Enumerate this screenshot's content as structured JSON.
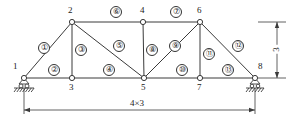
{
  "diagram": {
    "stroke_color": "#3a3a3a",
    "label_color": "#1a1a1a",
    "background": "#ffffff"
  },
  "nodes": [
    {
      "id": "1",
      "label": "1",
      "x": 24,
      "y": 78,
      "lx": 13,
      "ly": 62
    },
    {
      "id": "2",
      "label": "2",
      "x": 72,
      "y": 22,
      "lx": 68,
      "ly": 6
    },
    {
      "id": "3",
      "label": "3",
      "x": 72,
      "y": 78,
      "lx": 69,
      "ly": 83
    },
    {
      "id": "4",
      "label": "4",
      "x": 143,
      "y": 22,
      "lx": 140,
      "ly": 6
    },
    {
      "id": "5",
      "label": "5",
      "x": 144,
      "y": 78,
      "lx": 141,
      "ly": 83
    },
    {
      "id": "6",
      "label": "6",
      "x": 200,
      "y": 22,
      "lx": 197,
      "ly": 6
    },
    {
      "id": "7",
      "label": "7",
      "x": 200,
      "y": 78,
      "lx": 197,
      "ly": 83
    },
    {
      "id": "8",
      "label": "8",
      "x": 255,
      "y": 78,
      "lx": 258,
      "ly": 62
    }
  ],
  "members": [
    {
      "id": "1",
      "label": "①",
      "from": "1",
      "to": "2",
      "lx": 38,
      "ly": 42
    },
    {
      "id": "2",
      "label": "②",
      "from": "1",
      "to": "3",
      "lx": 48,
      "ly": 64
    },
    {
      "id": "3",
      "label": "③",
      "from": "2",
      "to": "3",
      "lx": 75,
      "ly": 44
    },
    {
      "id": "4",
      "label": "④",
      "from": "3",
      "to": "5",
      "lx": 103,
      "ly": 64
    },
    {
      "id": "5",
      "label": "⑤",
      "from": "2",
      "to": "5",
      "lx": 113,
      "ly": 40
    },
    {
      "id": "6",
      "label": "⑥",
      "from": "2",
      "to": "4",
      "lx": 110,
      "ly": 6
    },
    {
      "id": "7",
      "label": "⑦",
      "from": "4",
      "to": "6",
      "lx": 170,
      "ly": 6
    },
    {
      "id": "8",
      "label": "⑧",
      "from": "4",
      "to": "5",
      "lx": 146,
      "ly": 44
    },
    {
      "id": "9",
      "label": "⑨",
      "from": "5",
      "to": "6",
      "lx": 169,
      "ly": 40
    },
    {
      "id": "10",
      "label": "⑩",
      "from": "5",
      "to": "7",
      "lx": 176,
      "ly": 64
    },
    {
      "id": "11",
      "label": "⑪",
      "from": "6",
      "to": "7",
      "lx": 203,
      "ly": 48
    },
    {
      "id": "12",
      "label": "⑫",
      "from": "6",
      "to": "8",
      "lx": 232,
      "ly": 40
    },
    {
      "id": "13",
      "label": "⑬",
      "from": "7",
      "to": "8",
      "lx": 222,
      "ly": 64
    }
  ],
  "supports": [
    {
      "node": "1",
      "type": "pin-roller-support"
    },
    {
      "node": "8",
      "type": "roller-support"
    }
  ],
  "dimensions": {
    "horizontal": {
      "label": "4×3",
      "lx": 128,
      "ly": 99,
      "from_x": 24,
      "to_x": 255,
      "y": 110
    },
    "vertical": {
      "label": "3",
      "lx": 272,
      "ly": 45,
      "x": 277,
      "from_y": 22,
      "to_y": 78
    }
  }
}
